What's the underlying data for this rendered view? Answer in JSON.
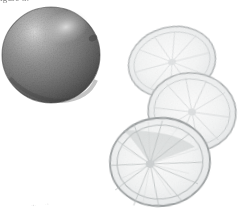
{
  "figure": {
    "name": "citrus-fruit-scan",
    "background_color": "#ffffff",
    "width": 239,
    "height": 216,
    "clipped_caption_text": "igure 3.",
    "scan_specks": [
      {
        "text": "·▪·"
      },
      {
        "text": "·▫"
      }
    ]
  },
  "whole_fruit": {
    "label": "whole-citrus-fruit",
    "center_x": 51,
    "center_y": 55,
    "radius_x": 49,
    "radius_y": 48,
    "body_color": "#8c8c8c",
    "shadow_color": "#4f4f4f",
    "highlight_color": "#d8d8d8",
    "rim_color": "#3d3d3d",
    "highlight_x": 66,
    "highlight_y": 26,
    "texture": "stippled-peel"
  },
  "slices": [
    {
      "label": "citrus-slice-top",
      "center_x": 172,
      "center_y": 62,
      "radius_x": 44,
      "radius_y": 35,
      "rotation": -14,
      "rind_color": "#b9bcbd",
      "pulp_color": "#f4f5f5",
      "vein_color": "#d5d8d9",
      "segments": 10
    },
    {
      "label": "citrus-slice-middle",
      "center_x": 192,
      "center_y": 112,
      "radius_x": 44,
      "radius_y": 39,
      "rotation": 8,
      "rind_color": "#b4b7b8",
      "pulp_color": "#f1f2f3",
      "vein_color": "#cfd2d3",
      "segments": 10
    },
    {
      "label": "citrus-slice-front",
      "center_x": 160,
      "center_y": 162,
      "radius_x": 50,
      "radius_y": 44,
      "rotation": -5,
      "rind_color": "#9fa3a4",
      "pulp_color": "#eceeef",
      "vein_color": "#bcc0c1",
      "segments": 11,
      "core_x": 150,
      "core_y": 163
    }
  ]
}
